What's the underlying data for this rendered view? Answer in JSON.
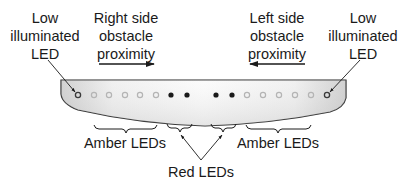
{
  "labels": {
    "low_led_left": [
      "Low",
      "illuminated",
      "LED"
    ],
    "low_led_right": [
      "Low",
      "illuminated",
      "LED"
    ],
    "right_side": [
      "Right side",
      "obstacle",
      "proximity"
    ],
    "left_side": [
      "Left side",
      "obstacle",
      "proximity"
    ],
    "amber_left": "Amber LEDs",
    "amber_right": "Amber LEDs",
    "red": "Red LEDs"
  },
  "led_bar": {
    "leds": [
      {
        "x": 78,
        "type": "low-illuminated"
      },
      {
        "x": 94,
        "type": "amber"
      },
      {
        "x": 109,
        "type": "amber"
      },
      {
        "x": 125,
        "type": "amber"
      },
      {
        "x": 140,
        "type": "amber"
      },
      {
        "x": 156,
        "type": "amber"
      },
      {
        "x": 171,
        "type": "red"
      },
      {
        "x": 187,
        "type": "red"
      },
      {
        "x": 216,
        "type": "red"
      },
      {
        "x": 232,
        "type": "red"
      },
      {
        "x": 247,
        "type": "amber"
      },
      {
        "x": 263,
        "type": "amber"
      },
      {
        "x": 279,
        "type": "amber"
      },
      {
        "x": 295,
        "type": "amber"
      },
      {
        "x": 311,
        "type": "amber"
      },
      {
        "x": 327,
        "type": "low-illuminated"
      }
    ]
  },
  "colors": {
    "outline": "#2a2a2a",
    "bar_fill_light": "#fafafa",
    "bar_fill_dark": "#c8c8c8",
    "amber_led": "#b4b4b4",
    "red_led": "#1a1a1a",
    "low_led": "#3a3a3a"
  }
}
